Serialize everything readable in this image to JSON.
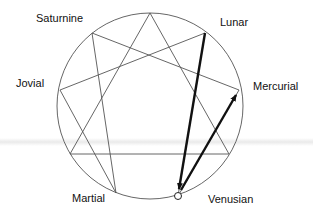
{
  "diagram": {
    "type": "enneagram",
    "circle": {
      "cx": 150,
      "cy": 106,
      "r": 93,
      "stroke": "#555555"
    },
    "points": {
      "top": {
        "x": 150,
        "y": 13
      },
      "lunar": {
        "x": 205,
        "y": 33
      },
      "mercurial": {
        "x": 239,
        "y": 90
      },
      "p3": {
        "x": 229,
        "y": 154
      },
      "venusian": {
        "x": 178,
        "y": 196
      },
      "martial": {
        "x": 116,
        "y": 193
      },
      "p6": {
        "x": 70,
        "y": 154
      },
      "jovial": {
        "x": 60,
        "y": 90
      },
      "saturnine": {
        "x": 92,
        "y": 33
      }
    },
    "labels": {
      "saturnine": "Saturnine",
      "lunar": "Lunar",
      "jovial": "Jovial",
      "mercurial": "Mercurial",
      "martial": "Martial",
      "venusian": "Venusian"
    },
    "arrows": [
      {
        "from": "Lunar",
        "to": "Venusian"
      },
      {
        "from": "Venusian",
        "to": "Mercurial"
      }
    ]
  }
}
